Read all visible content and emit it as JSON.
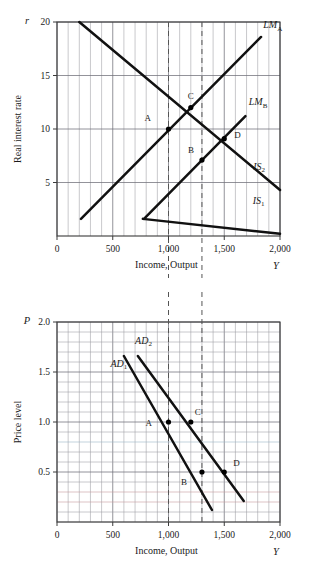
{
  "figure": {
    "name": "IS-LM and Aggregate Demand derivation",
    "panels": [
      "top",
      "bottom"
    ]
  },
  "chart_data": [
    {
      "type": "line",
      "panel": "top",
      "title": "",
      "xlabel": "Income, Output",
      "ylabel": "Real interest rate",
      "x_axis_symbol": "Y",
      "y_axis_symbol": "r",
      "xlim": [
        0,
        2000
      ],
      "ylim": [
        0,
        20
      ],
      "xticks": [
        0,
        500,
        1000,
        1500,
        2000
      ],
      "xticklabels": [
        "0",
        "500",
        "1,000",
        "1,500",
        "2,000"
      ],
      "yticks": [
        5,
        10,
        15,
        20
      ],
      "yticklabels": [
        "5",
        "10",
        "15",
        "20"
      ],
      "grid": "vertical minor every 100, horizontal at major y ticks",
      "legend": "inline curve labels",
      "series": [
        {
          "name": "IS1",
          "label": "IS",
          "sub": "1",
          "points": [
            [
              770,
              1.6
            ],
            [
              2000,
              0.2
            ]
          ],
          "line_from": [
            770,
            1.6
          ],
          "line_to": [
            2000,
            0.2
          ],
          "label_x": 1755,
          "label_y": 3.0
        },
        {
          "name": "IS2",
          "label": "IS",
          "sub": "2",
          "line_from": [
            200,
            20.0
          ],
          "line_to": [
            2000,
            4.3
          ],
          "label_x": 1760,
          "label_y": 6.2
        },
        {
          "name": "LMA",
          "label": "LM",
          "sub": "A",
          "line_from": [
            215,
            1.6
          ],
          "line_to": [
            1830,
            18.6
          ],
          "label_x": 1850,
          "label_y": 19.4
        },
        {
          "name": "LMB",
          "label": "LM",
          "sub": "B",
          "line_from": [
            780,
            1.6
          ],
          "line_to": [
            1690,
            11.2
          ],
          "label_x": 1720,
          "label_y": 12.2
        }
      ],
      "points": [
        {
          "label": "A",
          "x": 1000,
          "y": 10.0,
          "label_dx": -24,
          "label_dy": -8
        },
        {
          "label": "B",
          "x": 1300,
          "y": 7.1,
          "label_dx": -14,
          "label_dy": -7
        },
        {
          "label": "C",
          "x": 1200,
          "y": 12.0,
          "label_dx": -3,
          "label_dy": -9
        },
        {
          "label": "D",
          "x": 1500,
          "y": 9.1,
          "label_dx": 10,
          "label_dy": -1
        }
      ],
      "reference_lines": [
        {
          "orientation": "vertical",
          "x": 1000,
          "style": "dashed"
        },
        {
          "orientation": "vertical",
          "x": 1300,
          "style": "dashed"
        }
      ]
    },
    {
      "type": "line",
      "panel": "bottom",
      "title": "",
      "xlabel": "Income, Output",
      "ylabel": "Price level",
      "x_axis_symbol": "Y",
      "y_axis_symbol": "P",
      "xlim": [
        0,
        2000
      ],
      "ylim": [
        0,
        2.0
      ],
      "xticks": [
        0,
        500,
        1000,
        1500,
        2000
      ],
      "xticklabels": [
        "0",
        "500",
        "1,000",
        "1,500",
        "2,000"
      ],
      "yticks": [
        0.5,
        1.0,
        1.5,
        2.0
      ],
      "yticklabels": [
        "0.5",
        "1.0",
        "1.5",
        "2.0"
      ],
      "grid": "full minor grid, 100 units x by 0.1 y",
      "legend": "inline curve labels",
      "series": [
        {
          "name": "AD1",
          "label": "AD",
          "sub": "1",
          "line_from": [
            600,
            1.66
          ],
          "line_to": [
            1390,
            0.12
          ],
          "label_x": 480,
          "label_y": 1.55
        },
        {
          "name": "AD2",
          "label": "AD",
          "sub": "2",
          "line_from": [
            725,
            1.66
          ],
          "line_to": [
            1675,
            0.21
          ],
          "label_x": 700,
          "label_y": 1.78
        }
      ],
      "points": [
        {
          "label": "A",
          "x": 1000,
          "y": 1.0,
          "label_dx": -23,
          "label_dy": 4
        },
        {
          "label": "C",
          "x": 1200,
          "y": 1.0,
          "label_dx": 4,
          "label_dy": -7
        },
        {
          "label": "B",
          "x": 1300,
          "y": 0.5,
          "label_dx": -21,
          "label_dy": 13
        },
        {
          "label": "D",
          "x": 1500,
          "y": 0.5,
          "label_dx": 9,
          "label_dy": -6
        }
      ],
      "reference_lines": [
        {
          "orientation": "vertical",
          "x": 1000,
          "style": "dashed"
        },
        {
          "orientation": "vertical",
          "x": 1300,
          "style": "dashed"
        }
      ]
    }
  ]
}
